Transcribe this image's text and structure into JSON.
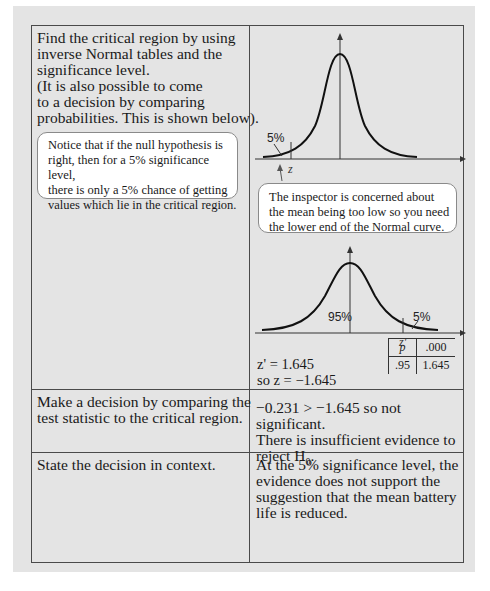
{
  "rows": [
    {
      "left": {
        "lines": [
          "Find the critical region by using",
          "inverse Normal tables and the",
          "significance level.",
          "(It is also possible to come",
          "to a decision by comparing",
          "probabilities. This is shown below)."
        ],
        "callout": [
          "Notice that if the null hypothesis is",
          "right, then for a 5% significance level,",
          "there is only a 5% chance of getting",
          "values which lie in the critical region."
        ]
      },
      "right": {
        "top_curve": {
          "tail_label": "5%",
          "critical_label": "z"
        },
        "callout": [
          "The inspector is concerned about",
          "the mean being too low so you need",
          "the lower end of the Normal curve."
        ],
        "bottom_curve": {
          "body_label": "95%",
          "tail_label": "5%",
          "critical_label": "z'"
        },
        "result_lines": [
          "z' = 1.645",
          "so z = −1.645"
        ],
        "lookup_table": {
          "header": [
            "p",
            ".000"
          ],
          "row": [
            ".95",
            "1.645"
          ]
        }
      }
    },
    {
      "left": {
        "lines": [
          "Make a decision by comparing the",
          "test statistic to the critical region."
        ]
      },
      "right": {
        "lines": [
          "−0.231 > −1.645 so not significant.",
          "There is insufficient evidence to"
        ],
        "last_prefix": "reject H",
        "last_sub": "0",
        "last_suffix": "."
      }
    },
    {
      "left": {
        "lines": [
          "State the decision in context."
        ]
      },
      "right": {
        "lines": [
          "At the 5% significance level, the",
          "evidence does not support the",
          "suggestion that the mean battery",
          "life is reduced."
        ]
      }
    }
  ],
  "colors": {
    "panel_bg": "#e4e4e4",
    "border": "#4a4a4a",
    "callout_bg": "#ffffff"
  }
}
